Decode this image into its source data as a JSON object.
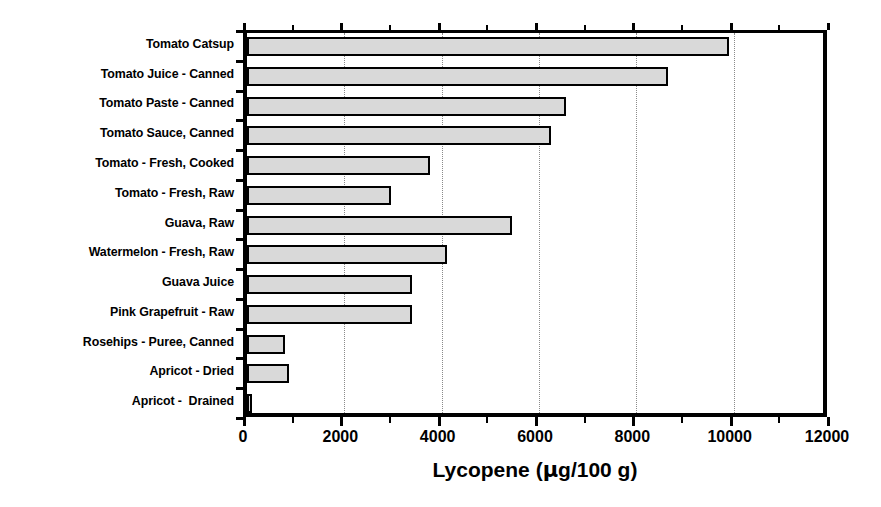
{
  "chart_data": {
    "type": "bar",
    "orientation": "horizontal",
    "title": "",
    "xlabel": "Lycopene (µg/100 g)",
    "ylabel": "",
    "xlim": [
      0,
      12000
    ],
    "xticks": [
      0,
      2000,
      4000,
      6000,
      8000,
      10000,
      12000
    ],
    "xtick_labels": [
      "0",
      "2000",
      "4000",
      "6000",
      "8000",
      "10000",
      "12000"
    ],
    "minor_tick_interval": 1000,
    "grid": "vertical dotted at major x ticks",
    "legend": "none",
    "bar_fill_color": "#d9d9d9",
    "bar_edge_color": "#000000",
    "categories": [
      "Tomato Catsup",
      "Tomato Juice - Canned",
      "Tomato Paste - Canned",
      "Tomato Sauce, Canned",
      "Tomato - Fresh, Cooked",
      "Tomato - Fresh, Raw",
      "Guava, Raw",
      "Watermelon - Fresh, Raw",
      "Guava Juice",
      "Pink Grapefruit - Raw",
      "Rosehips - Puree, Canned",
      "Apricot - Dried",
      "Apricot -  Drained"
    ],
    "values": [
      9900,
      8650,
      6550,
      6250,
      3750,
      2950,
      5450,
      4100,
      3400,
      3400,
      780,
      860,
      85
    ],
    "units": "µg/100 g"
  },
  "axis": {
    "title_prefix": "Lycopene (",
    "title_mu": "µ",
    "title_suffix": "g/100 g)"
  }
}
